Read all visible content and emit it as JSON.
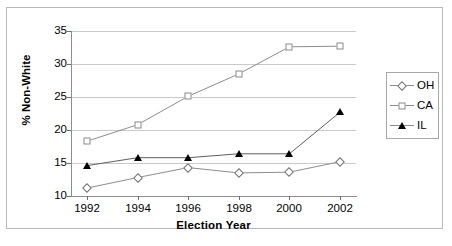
{
  "chart_data": {
    "type": "line",
    "title": "",
    "xlabel": "Election Year",
    "ylabel": "% Non-White",
    "categories": [
      "1992",
      "1994",
      "1996",
      "1998",
      "2000",
      "2002"
    ],
    "x": [
      1992,
      1994,
      1996,
      1998,
      2000,
      2002
    ],
    "xlim": [
      1991,
      2003
    ],
    "ylim": [
      10,
      35
    ],
    "yticks": [
      "10",
      "15",
      "20",
      "25",
      "30",
      "35"
    ],
    "ytick_values": [
      10,
      15,
      20,
      25,
      30,
      35
    ],
    "grid": "horizontal",
    "legend_position": "right",
    "series": [
      {
        "name": "OH",
        "marker": "open-diamond",
        "values": [
          11.2,
          12.8,
          14.3,
          13.5,
          13.6,
          15.2
        ]
      },
      {
        "name": "CA",
        "marker": "open-square",
        "values": [
          18.3,
          20.8,
          25.1,
          28.5,
          32.6,
          32.7
        ]
      },
      {
        "name": "IL",
        "marker": "filled-triangle",
        "values": [
          14.6,
          15.8,
          15.8,
          16.4,
          16.4,
          22.7
        ]
      }
    ]
  },
  "legend": {
    "items": [
      {
        "label": "OH",
        "marker": "open-diamond"
      },
      {
        "label": "CA",
        "marker": "open-square"
      },
      {
        "label": "IL",
        "marker": "filled-triangle"
      }
    ]
  },
  "colors": {
    "grid": "#c9c9c9",
    "axis": "#8d8d8d",
    "series_line": "#8d8d8d",
    "il_marker": "#000000",
    "background": "#ffffff",
    "frame": "#b9b9b9"
  },
  "caption": ""
}
